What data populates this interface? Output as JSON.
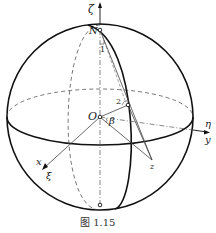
{
  "figure": {
    "caption": "图 1.15",
    "labels": {
      "zeta": "ζ",
      "north": "N",
      "point1": "1",
      "point2": "2",
      "origin": "O",
      "beta": "β",
      "eta": "η",
      "y": "y",
      "x": "x",
      "xi": "ξ",
      "z": "z"
    }
  }
}
